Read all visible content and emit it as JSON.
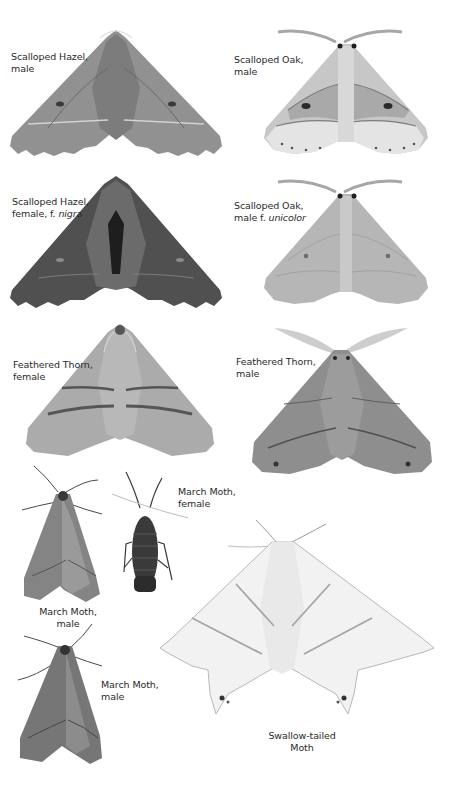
{
  "plate": {
    "specimens": [
      {
        "id": "scalloped-hazel-male",
        "name": "Scalloped Hazel,",
        "sex": "male",
        "form": ""
      },
      {
        "id": "scalloped-oak-male",
        "name": "Scalloped Oak,",
        "sex": "male",
        "form": ""
      },
      {
        "id": "scalloped-hazel-female-nigra",
        "name": "Scalloped Hazel,",
        "sex": "female, f.",
        "form": "nigra"
      },
      {
        "id": "scalloped-oak-male-unicolor",
        "name": "Scalloped Oak,",
        "sex": "male f.",
        "form": "unicolor"
      },
      {
        "id": "feathered-thorn-female",
        "name": "Feathered Thorn,",
        "sex": "female",
        "form": ""
      },
      {
        "id": "feathered-thorn-male",
        "name": "Feathered Thorn,",
        "sex": "male",
        "form": ""
      },
      {
        "id": "march-moth-male-1",
        "name": "March Moth,",
        "sex": "male",
        "form": ""
      },
      {
        "id": "march-moth-female",
        "name": "March Moth,",
        "sex": "female",
        "form": ""
      },
      {
        "id": "march-moth-male-2",
        "name": "March Moth,",
        "sex": "male",
        "form": ""
      },
      {
        "id": "swallow-tailed-moth",
        "name": "Swallow-tailed",
        "sex": "Moth",
        "form": ""
      }
    ]
  },
  "colors": {
    "hazel_male": "#8f8f8f",
    "hazel_female_nigra": "#4e4e4e",
    "oak_male": "#b9b9b9",
    "oak_unicolor": "#b4b4b4",
    "thorn_female": "#a9a9a9",
    "thorn_male": "#8c8c8c",
    "march_male": "#828282",
    "march_female": "#3c3c3c",
    "swallow_tail": "#efefef"
  }
}
